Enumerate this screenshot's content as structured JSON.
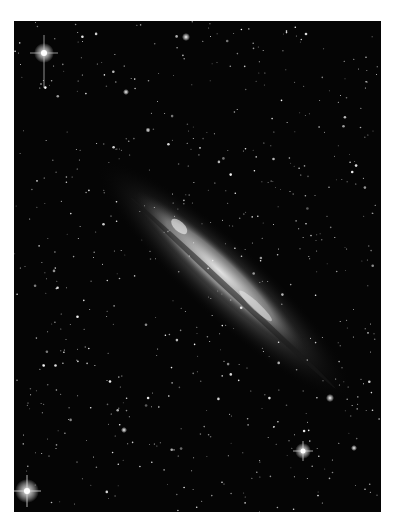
{
  "image": {
    "subject": "edge-on spiral galaxy in star field",
    "background_color": "#050505",
    "border_color": "#ffffff",
    "galaxy": {
      "center_x": 211,
      "center_y": 259,
      "length": 330,
      "width": 60,
      "angle_deg": 43
    },
    "bright_stars": [
      {
        "x": 30,
        "y": 32,
        "r": 4
      },
      {
        "x": 13,
        "y": 470,
        "r": 4
      },
      {
        "x": 289,
        "y": 430,
        "r": 3
      },
      {
        "x": 316,
        "y": 377,
        "r": 2
      },
      {
        "x": 172,
        "y": 16,
        "r": 2
      },
      {
        "x": 112,
        "y": 71,
        "r": 1.5
      },
      {
        "x": 110,
        "y": 409,
        "r": 2
      }
    ]
  }
}
